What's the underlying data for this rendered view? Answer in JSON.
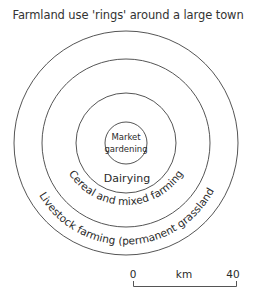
{
  "title": "Farmland use 'rings' around a large town",
  "zones": [
    {
      "label_line1": "Market",
      "label_line2": "gardening",
      "ring": "innermost"
    },
    {
      "label": "Dairying",
      "ring": "second"
    },
    {
      "label": "Cereal and mixed farming",
      "ring": "third"
    },
    {
      "label": "Livestock farming (permanent grassland",
      "ring": "outer"
    }
  ],
  "scale": {
    "start": "0",
    "unit": "km",
    "end": "40"
  }
}
